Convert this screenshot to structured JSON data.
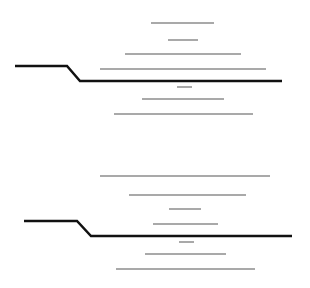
{
  "canvas": {
    "width": 310,
    "height": 288,
    "background": "#ffffff"
  },
  "colors": {
    "profile": "#111111",
    "contour": "#a9a9a9"
  },
  "panels": [
    {
      "name": "upper",
      "profile": {
        "points": [
          [
            15,
            66
          ],
          [
            67,
            66
          ],
          [
            80,
            81
          ],
          [
            282,
            81
          ]
        ],
        "stroke_width": 2.5
      },
      "contours": [
        {
          "x1": 151,
          "x2": 214,
          "y": 23
        },
        {
          "x1": 168,
          "x2": 198,
          "y": 40
        },
        {
          "x1": 125,
          "x2": 241,
          "y": 54
        },
        {
          "x1": 100,
          "x2": 266,
          "y": 69
        },
        {
          "x1": 177,
          "x2": 192,
          "y": 87
        },
        {
          "x1": 142,
          "x2": 224,
          "y": 99
        },
        {
          "x1": 114,
          "x2": 253,
          "y": 114
        }
      ]
    },
    {
      "name": "lower",
      "profile": {
        "points": [
          [
            24,
            221
          ],
          [
            77,
            221
          ],
          [
            91,
            236
          ],
          [
            292,
            236
          ]
        ],
        "stroke_width": 2.5
      },
      "contours": [
        {
          "x1": 100,
          "x2": 270,
          "y": 176
        },
        {
          "x1": 129,
          "x2": 246,
          "y": 195
        },
        {
          "x1": 169,
          "x2": 201,
          "y": 209
        },
        {
          "x1": 153,
          "x2": 218,
          "y": 224
        },
        {
          "x1": 179,
          "x2": 194,
          "y": 242
        },
        {
          "x1": 145,
          "x2": 226,
          "y": 254
        },
        {
          "x1": 116,
          "x2": 255,
          "y": 269
        }
      ]
    }
  ]
}
